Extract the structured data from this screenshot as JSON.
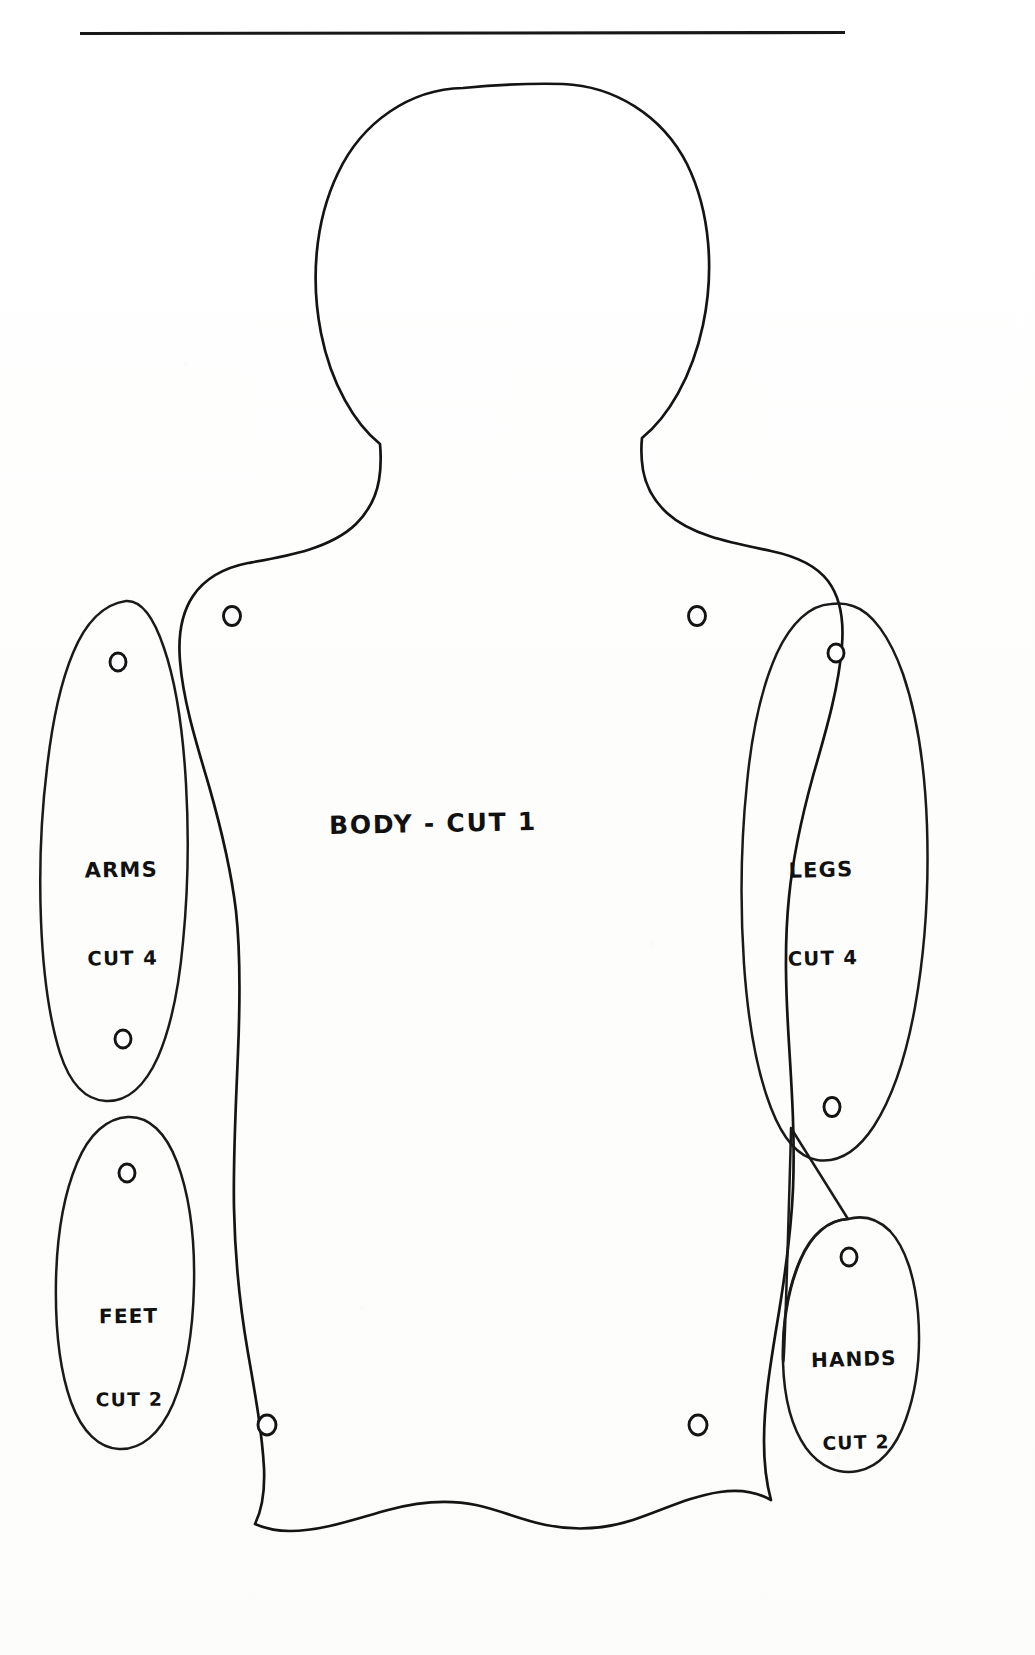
{
  "sheet": {
    "title": "Rag Doll Sewing Pattern Sheet",
    "medium": "hand-drawn ink on white paper",
    "width": 1035,
    "height": 1655,
    "paper_color": "#fefefe",
    "ink_color": "#111111"
  },
  "rule": {
    "name": "top-horizontal-rule",
    "x_start": 80,
    "x_end": 845,
    "y": 33,
    "thickness": 3
  },
  "pieces": [
    {
      "id": "body",
      "label_line1": "Body - Cut 1",
      "label_line2": "",
      "piece_name": "Body",
      "cut_count": 1,
      "holes": 4,
      "shape": "torso-with-head"
    },
    {
      "id": "arms",
      "label_line1": "Arms",
      "label_line2": "Cut 4",
      "piece_name": "Arms",
      "cut_count": 4,
      "holes": 2,
      "shape": "tall-oval"
    },
    {
      "id": "legs",
      "label_line1": "Legs",
      "label_line2": "Cut 4",
      "piece_name": "Legs",
      "cut_count": 4,
      "holes": 2,
      "shape": "tall-oval"
    },
    {
      "id": "feet",
      "label_line1": "Feet",
      "label_line2": "Cut 2",
      "piece_name": "Feet",
      "cut_count": 2,
      "holes": 1,
      "shape": "oval"
    },
    {
      "id": "hands",
      "label_line1": "Hands",
      "label_line2": "Cut 2",
      "piece_name": "Hands",
      "cut_count": 2,
      "holes": 1,
      "shape": "small-oval"
    }
  ],
  "labels": {
    "body": {
      "line1": "Body - Cut 1",
      "line2": ""
    },
    "arms": {
      "line1": "Arms",
      "line2": "Cut 4"
    },
    "legs": {
      "line1": "Legs",
      "line2": "Cut 4"
    },
    "feet": {
      "line1": "Feet",
      "line2": "Cut 2"
    },
    "hands": {
      "line1": "Hands",
      "line2": "Cut 2"
    }
  }
}
